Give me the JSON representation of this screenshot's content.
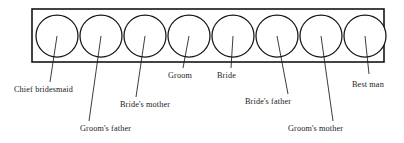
{
  "diagram": {
    "type": "receiving-line",
    "background_color": "#ffffff",
    "stroke_color": "#141414",
    "text_color": "#1a1a1a",
    "box": {
      "x": 32,
      "y": 9,
      "width": 352,
      "height": 53
    },
    "circle_count": 8,
    "circle_radius": 21,
    "circle_centers_y": 36,
    "people": [
      {
        "order": 1,
        "label": "Chief bridesmaid",
        "circle_cx": 57,
        "leader": {
          "x1": 57,
          "y1": 36,
          "x2": 50,
          "y2": 82
        },
        "text_x": 14,
        "text_y": 92
      },
      {
        "order": 2,
        "label": "Groom's father",
        "circle_cx": 101,
        "leader": {
          "x1": 101,
          "y1": 36,
          "x2": 89,
          "y2": 121
        },
        "text_x": 80,
        "text_y": 131
      },
      {
        "order": 3,
        "label": "Bride's mother",
        "circle_cx": 145,
        "leader": {
          "x1": 145,
          "y1": 36,
          "x2": 136,
          "y2": 97
        },
        "text_x": 120,
        "text_y": 107
      },
      {
        "order": 4,
        "label": "Groom",
        "circle_cx": 189,
        "leader": {
          "x1": 189,
          "y1": 36,
          "x2": 183,
          "y2": 68
        },
        "text_x": 168,
        "text_y": 78
      },
      {
        "order": 5,
        "label": "Bride",
        "circle_cx": 233,
        "leader": {
          "x1": 233,
          "y1": 36,
          "x2": 231,
          "y2": 68
        },
        "text_x": 217,
        "text_y": 78
      },
      {
        "order": 6,
        "label": "Bride's father",
        "circle_cx": 277,
        "leader": {
          "x1": 277,
          "y1": 36,
          "x2": 288,
          "y2": 94
        },
        "text_x": 245,
        "text_y": 104
      },
      {
        "order": 7,
        "label": "Groom's mother",
        "circle_cx": 321,
        "leader": {
          "x1": 321,
          "y1": 36,
          "x2": 333,
          "y2": 121
        },
        "text_x": 288,
        "text_y": 131
      },
      {
        "order": 8,
        "label": "Best man",
        "circle_cx": 365,
        "leader": {
          "x1": 365,
          "y1": 36,
          "x2": 369,
          "y2": 74
        },
        "text_x": 352,
        "text_y": 87
      }
    ]
  }
}
